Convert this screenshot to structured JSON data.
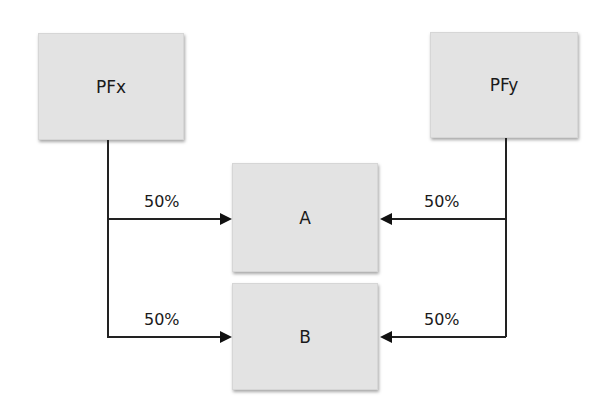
{
  "nodes": {
    "pfx": {
      "label": "PFx"
    },
    "pfy": {
      "label": "PFy"
    },
    "a": {
      "label": "A"
    },
    "b": {
      "label": "B"
    }
  },
  "edges": [
    {
      "from": "PFx",
      "to": "A",
      "label": "50%"
    },
    {
      "from": "PFx",
      "to": "B",
      "label": "50%"
    },
    {
      "from": "PFy",
      "to": "A",
      "label": "50%"
    },
    {
      "from": "PFy",
      "to": "B",
      "label": "50%"
    }
  ],
  "colors": {
    "box_fill": "#e3e3e3",
    "line": "#222222",
    "background": "#ffffff"
  }
}
